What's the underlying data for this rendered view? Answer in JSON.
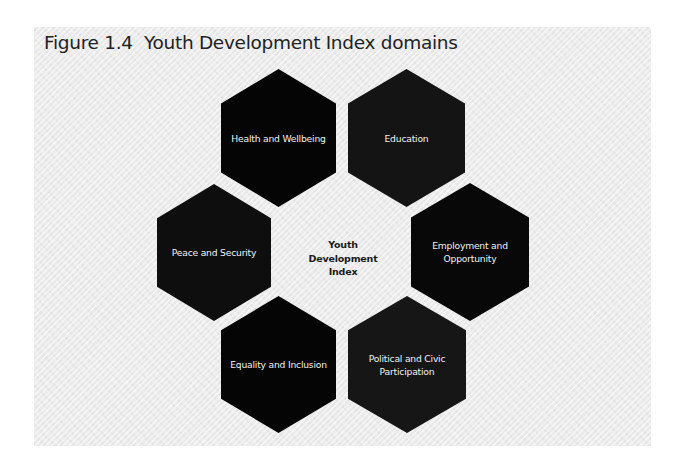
{
  "figure": {
    "title": "Figure 1.4  Youth Development Index domains",
    "center": {
      "lines": [
        "Youth",
        "Development",
        "Index"
      ]
    },
    "domains": [
      {
        "label": "Health and Wellbeing",
        "position": "top-left",
        "fill": "#050505"
      },
      {
        "label": "Education",
        "position": "top-right",
        "fill": "#141414"
      },
      {
        "label": "Employment and Opportunity",
        "position": "right",
        "fill": "#080808"
      },
      {
        "label": "Political and Civic Participation",
        "position": "bottom-right",
        "fill": "#161616"
      },
      {
        "label": "Equality and Inclusion",
        "position": "bottom-left",
        "fill": "#050505"
      },
      {
        "label": "Peace and Security",
        "position": "left",
        "fill": "#0e0e0e"
      }
    ],
    "colors": {
      "background": "#ebebeb",
      "title_text": "#222222",
      "hex_text": "#f2f2f2",
      "center_text": "#1a1a1a"
    }
  }
}
